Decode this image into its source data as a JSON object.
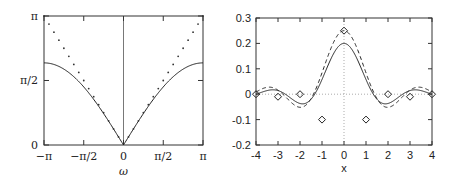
{
  "chart_data": [
    {
      "type": "line",
      "title": "",
      "xlabel": "ω",
      "ylabel": "",
      "xlim": [
        -3.14159,
        3.14159
      ],
      "ylim": [
        0,
        3.14159
      ],
      "x_ticks": [
        "−π",
        "−π/2",
        "0",
        "π/2",
        "π"
      ],
      "y_ticks": [
        "0",
        "π/2",
        "π"
      ],
      "grid": false,
      "legend": [],
      "series": [
        {
          "name": "dotted (|ω|)",
          "style": "dotted",
          "x": [
            -3.1416,
            -2.3562,
            -1.5708,
            -0.7854,
            0,
            0.7854,
            1.5708,
            2.3562,
            3.1416
          ],
          "values": [
            3.1416,
            2.3562,
            1.5708,
            0.7854,
            0,
            0.7854,
            1.5708,
            2.3562,
            3.1416
          ]
        },
        {
          "name": "solid",
          "style": "solid",
          "x": [
            -3.1416,
            -2.3562,
            -1.5708,
            -0.7854,
            0,
            0.7854,
            1.5708,
            2.3562,
            3.1416
          ],
          "values": [
            2.0,
            1.85,
            1.41,
            0.77,
            0,
            0.77,
            1.41,
            1.85,
            2.0
          ]
        }
      ]
    },
    {
      "type": "line",
      "title": "",
      "xlabel": "x",
      "ylabel": "",
      "xlim": [
        -4,
        4
      ],
      "ylim": [
        -0.2,
        0.3
      ],
      "x_ticks": [
        "-4",
        "-3",
        "-2",
        "-1",
        "0",
        "1",
        "2",
        "3",
        "4"
      ],
      "y_ticks": [
        "-0.2",
        "-0.1",
        "0",
        "0.1",
        "0.2",
        "0.3"
      ],
      "grid": false,
      "reference_lines": [
        "y=0 dotted",
        "x=0 dotted"
      ],
      "legend": [],
      "series": [
        {
          "name": "solid",
          "style": "solid",
          "x": [
            -4,
            -3.5,
            -3,
            -2.5,
            -2,
            -1.5,
            -1.3,
            -1,
            -0.5,
            0,
            0.5,
            1,
            1.3,
            1.5,
            2,
            2.5,
            3,
            3.5,
            4
          ],
          "values": [
            0,
            -0.02,
            -0.01,
            0.03,
            0,
            -0.1,
            -0.11,
            -0.07,
            0.1,
            0.2,
            0.1,
            -0.07,
            -0.11,
            -0.1,
            0,
            0.03,
            -0.01,
            -0.02,
            0
          ]
        },
        {
          "name": "dashed",
          "style": "dashed",
          "x": [
            -4,
            -3.5,
            -3,
            -2.5,
            -2,
            -1.5,
            -1.4,
            -1,
            -0.5,
            0,
            0.5,
            1,
            1.4,
            1.5,
            2,
            2.5,
            3,
            3.5,
            4
          ],
          "values": [
            0,
            -0.04,
            -0.02,
            0.055,
            0,
            -0.14,
            -0.15,
            -0.1,
            0.12,
            0.25,
            0.12,
            -0.1,
            -0.15,
            -0.14,
            0,
            0.055,
            -0.02,
            -0.04,
            0
          ]
        },
        {
          "name": "diamond markers",
          "style": "markers",
          "x": [
            -4,
            -3,
            -2,
            -1,
            0,
            1,
            2,
            3,
            4
          ],
          "values": [
            0,
            -0.01,
            0,
            -0.1,
            0.25,
            -0.1,
            0,
            -0.01,
            0
          ]
        }
      ]
    }
  ]
}
